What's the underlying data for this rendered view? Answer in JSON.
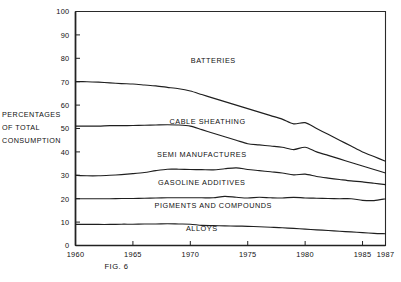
{
  "figure": {
    "caption": "FIG. 6",
    "axis_label_lines": [
      "PERCENTAGES",
      "OF  TOTAL",
      "CONSUMPTION"
    ]
  },
  "chart_data": {
    "type": "area",
    "title": "",
    "subtitle": "",
    "xlabel": "",
    "ylabel": "PERCENTAGES OF TOTAL CONSUMPTION",
    "xlim": [
      1960,
      1987
    ],
    "ylim": [
      0,
      100
    ],
    "grid": false,
    "legend_position": "inline-band-labels",
    "stacked": true,
    "annotations": [
      "FIG. 6"
    ],
    "xticks": [
      1960,
      1965,
      1970,
      1975,
      1980,
      1985,
      1987
    ],
    "xticklabels": [
      "1960",
      "1965",
      "1970",
      "1975",
      "1980",
      "1985",
      "1987"
    ],
    "yticks": [
      0,
      10,
      20,
      30,
      40,
      50,
      60,
      70,
      80,
      90,
      100
    ],
    "yticklabels": [
      "0",
      "10",
      "20",
      "30",
      "40",
      "50",
      "60",
      "70",
      "80",
      "90",
      "100"
    ],
    "x": [
      1960,
      1961,
      1962,
      1963,
      1964,
      1965,
      1966,
      1967,
      1968,
      1969,
      1970,
      1971,
      1972,
      1973,
      1974,
      1975,
      1976,
      1977,
      1978,
      1979,
      1980,
      1981,
      1982,
      1983,
      1984,
      1985,
      1986,
      1987
    ],
    "band_labels": [
      {
        "name": "BATTERIES",
        "x": 1972.0,
        "y": 78
      },
      {
        "name": "CABLE SHEATHING",
        "x": 1971.5,
        "y": 52
      },
      {
        "name": "SEMI MANUFACTURES",
        "x": 1971.0,
        "y": 38
      },
      {
        "name": "GASOLINE ADDITIVES",
        "x": 1971.0,
        "y": 26
      },
      {
        "name": "PIGMENTS AND COMPOUNDS",
        "x": 1972.0,
        "y": 16
      },
      {
        "name": "ALLOYS",
        "x": 1971.0,
        "y": 6
      }
    ],
    "boundaries": [
      {
        "name": "top-of-cable-sheathing",
        "divides": [
          "BATTERIES",
          "CABLE SHEATHING"
        ],
        "values": [
          70,
          70,
          69.8,
          69.5,
          69.2,
          69,
          68.6,
          68.2,
          67.6,
          67,
          66,
          64.5,
          63,
          61.5,
          60,
          58.5,
          57,
          55.5,
          54,
          52,
          52.5,
          50,
          47.5,
          45,
          42.5,
          40,
          38,
          36
        ]
      },
      {
        "name": "top-of-semi-manufactures",
        "divides": [
          "CABLE SHEATHING",
          "SEMI MANUFACTURES"
        ],
        "values": [
          51,
          51,
          51,
          51.2,
          51.2,
          51.3,
          51.4,
          51.5,
          51.6,
          51.5,
          51,
          49.5,
          48,
          46.5,
          45,
          43.5,
          43,
          42.5,
          42,
          41,
          42,
          40,
          38.5,
          37,
          35.5,
          34,
          32.5,
          31
        ]
      },
      {
        "name": "top-of-gasoline-additives",
        "divides": [
          "SEMI MANUFACTURES",
          "GASOLINE ADDITIVES"
        ],
        "values": [
          30,
          29.8,
          29.8,
          30,
          30.3,
          30.7,
          31.2,
          32,
          32.6,
          32.6,
          32.5,
          32.4,
          32.3,
          32.8,
          33.2,
          32.5,
          32,
          31.5,
          31,
          30.2,
          30.5,
          29.5,
          28.8,
          28.2,
          27.6,
          27.2,
          26.6,
          26
        ]
      },
      {
        "name": "top-of-pigments-and-compounds",
        "divides": [
          "GASOLINE ADDITIVES",
          "PIGMENTS AND COMPOUNDS"
        ],
        "values": [
          20,
          20,
          20,
          20,
          20.1,
          20.1,
          20.2,
          20.3,
          20.4,
          20.4,
          20.4,
          20.4,
          20.4,
          21,
          20.6,
          20.3,
          20.6,
          20.4,
          20.3,
          20.6,
          20.3,
          20.2,
          20.1,
          20,
          20,
          19.3,
          19.2,
          20
        ]
      },
      {
        "name": "top-of-alloys",
        "divides": [
          "PIGMENTS AND COMPOUNDS",
          "ALLOYS"
        ],
        "values": [
          9,
          9,
          9,
          9,
          9.1,
          9.1,
          9.2,
          9.2,
          9.3,
          9.2,
          9.1,
          8.6,
          8.5,
          8.4,
          8.3,
          8.2,
          8,
          7.8,
          7.6,
          7.3,
          7,
          6.7,
          6.4,
          6.1,
          5.8,
          5.5,
          5.2,
          5
        ]
      }
    ]
  }
}
